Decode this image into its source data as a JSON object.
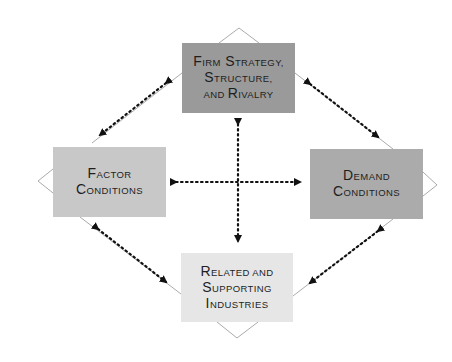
{
  "diagram": {
    "nodes": {
      "top": {
        "lines": [
          [
            {
              "cap": "F",
              "rest": "IRM"
            },
            {
              "cap": " S",
              "rest": "TRATEGY,"
            }
          ],
          [
            {
              "cap": "S",
              "rest": "TRUCTURE,"
            }
          ],
          [
            {
              "cap": "",
              "rest": "AND "
            },
            {
              "cap": "R",
              "rest": "IVALRY"
            }
          ]
        ],
        "text": "Firm Strategy, Structure, and Rivalry",
        "fill": "#9a9a9a"
      },
      "left": {
        "lines": [
          [
            {
              "cap": "F",
              "rest": "ACTOR"
            }
          ],
          [
            {
              "cap": "C",
              "rest": "ONDITIONS"
            }
          ]
        ],
        "text": "Factor Conditions",
        "fill": "#c8c8c8"
      },
      "right": {
        "lines": [
          [
            {
              "cap": "D",
              "rest": "EMAND"
            }
          ],
          [
            {
              "cap": "C",
              "rest": "ONDITIONS"
            }
          ]
        ],
        "text": "Demand Conditions",
        "fill": "#ababab"
      },
      "bottom": {
        "lines": [
          [
            {
              "cap": "R",
              "rest": "ELATED AND"
            }
          ],
          [
            {
              "cap": "S",
              "rest": "UPPORTING"
            }
          ],
          [
            {
              "cap": "I",
              "rest": "NDUSTRIES"
            }
          ]
        ],
        "text": "Related and Supporting Industries",
        "fill": "#e6e6e6"
      }
    },
    "connections": [
      {
        "from": "top",
        "to": "left",
        "style": "dotted",
        "bidirectional": true
      },
      {
        "from": "top",
        "to": "right",
        "style": "dotted",
        "bidirectional": true
      },
      {
        "from": "left",
        "to": "bottom",
        "style": "dotted",
        "bidirectional": true
      },
      {
        "from": "right",
        "to": "bottom",
        "style": "dotted",
        "bidirectional": true
      },
      {
        "from": "top",
        "to": "bottom",
        "style": "dotted",
        "bidirectional": true
      },
      {
        "from": "left",
        "to": "right",
        "style": "dotted",
        "bidirectional": true
      }
    ],
    "colors": {
      "outline": "#a0a0a0",
      "arrow": "#111111",
      "text": "#1e1e1e"
    }
  }
}
